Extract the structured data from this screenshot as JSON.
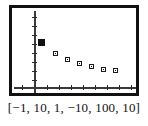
{
  "figure": {
    "caption": "[−1, 10, 1, −10, 100, 10]",
    "frame_color": "#111111",
    "axis_color": "#3a3a3a",
    "marker_color": "#1a1a1a",
    "background": "#ffffff"
  },
  "window_settings": {
    "xmin": -1,
    "xmax": 10,
    "xscl": 1,
    "ymin": -10,
    "ymax": 100,
    "yscl": 10
  },
  "chart_data": {
    "type": "scatter",
    "title": "",
    "subtitle": "",
    "xlabel": "",
    "ylabel": "",
    "xlim": [
      -1,
      10
    ],
    "ylim": [
      -10,
      100
    ],
    "xscl": 1,
    "yscl": 10,
    "grid": false,
    "legend": null,
    "x": [
      0,
      1,
      2,
      3,
      4,
      5,
      6
    ],
    "values": [
      100,
      70,
      55,
      45,
      40,
      33,
      30
    ],
    "series": [
      {
        "name": "plot1",
        "x": [
          0,
          1,
          2,
          3,
          4,
          5,
          6
        ],
        "values": [
          100,
          70,
          55,
          45,
          40,
          33,
          30
        ]
      }
    ],
    "xticks": [
      0,
      1,
      2,
      3,
      4,
      5,
      6,
      7,
      8,
      9
    ],
    "yticks": [
      0,
      10,
      20,
      30,
      40,
      50,
      60,
      70,
      80
    ],
    "xticklabels": [],
    "yticklabels": [],
    "annotations": []
  },
  "points": [
    {
      "name": "point-1",
      "x": 26.0,
      "y": 30.5,
      "style": "big"
    },
    {
      "name": "point-2",
      "x": 41.0,
      "y": 42.5,
      "style": "small"
    },
    {
      "name": "point-3",
      "x": 53.0,
      "y": 48.5,
      "style": "small"
    },
    {
      "name": "point-4",
      "x": 65.0,
      "y": 53.0,
      "style": "small"
    },
    {
      "name": "point-5",
      "x": 77.0,
      "y": 55.5,
      "style": "small"
    },
    {
      "name": "point-6",
      "x": 89.0,
      "y": 58.5,
      "style": "small"
    },
    {
      "name": "point-7",
      "x": 101.0,
      "y": 60.0,
      "style": "small"
    }
  ],
  "x_ticks": [
    {
      "x": 10.0
    },
    {
      "x": 34.5
    },
    {
      "x": 46.5
    },
    {
      "x": 58.5
    },
    {
      "x": 70.5
    },
    {
      "x": 82.5
    },
    {
      "x": 94.5
    },
    {
      "x": 106.5
    },
    {
      "x": 118.5
    }
  ],
  "y_ticks": [
    {
      "y": 9.0
    },
    {
      "y": 18.0
    },
    {
      "y": 27.0
    },
    {
      "y": 36.0
    },
    {
      "y": 45.0
    },
    {
      "y": 54.0
    },
    {
      "y": 63.0
    },
    {
      "y": 72.0
    }
  ]
}
